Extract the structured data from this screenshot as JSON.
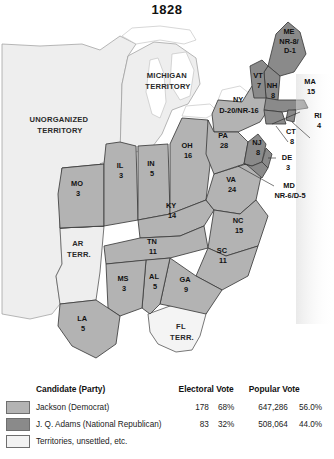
{
  "title": "1828",
  "colors": {
    "jackson": "#b3b3b3",
    "adams": "#8a8a8a",
    "territory": "#eeeeee",
    "water": "#ffffff",
    "border": "#3c3c3c"
  },
  "map": {
    "states": [
      {
        "code": "ME",
        "votes": "NR-8/\nD-1",
        "party": "adams"
      },
      {
        "code": "NH",
        "votes": "8",
        "party": "adams"
      },
      {
        "code": "VT",
        "votes": "7",
        "party": "adams"
      },
      {
        "code": "MA",
        "votes": "15",
        "party": "adams"
      },
      {
        "code": "RI",
        "votes": "4",
        "party": "adams"
      },
      {
        "code": "CT",
        "votes": "8",
        "party": "adams"
      },
      {
        "code": "NY",
        "votes": "D-20/NR-16",
        "party": "jackson"
      },
      {
        "code": "PA",
        "votes": "28",
        "party": "jackson"
      },
      {
        "code": "NJ",
        "votes": "8",
        "party": "adams"
      },
      {
        "code": "DE",
        "votes": "3",
        "party": "adams"
      },
      {
        "code": "MD",
        "votes": "NR-6/D-5",
        "party": "adams"
      },
      {
        "code": "VA",
        "votes": "24",
        "party": "jackson"
      },
      {
        "code": "NC",
        "votes": "15",
        "party": "jackson"
      },
      {
        "code": "SC",
        "votes": "11",
        "party": "jackson"
      },
      {
        "code": "GA",
        "votes": "9",
        "party": "jackson"
      },
      {
        "code": "AL",
        "votes": "5",
        "party": "jackson"
      },
      {
        "code": "MS",
        "votes": "3",
        "party": "jackson"
      },
      {
        "code": "LA",
        "votes": "5",
        "party": "jackson"
      },
      {
        "code": "TN",
        "votes": "11",
        "party": "jackson"
      },
      {
        "code": "KY",
        "votes": "14",
        "party": "jackson"
      },
      {
        "code": "OH",
        "votes": "16",
        "party": "jackson"
      },
      {
        "code": "IN",
        "votes": "5",
        "party": "jackson"
      },
      {
        "code": "IL",
        "votes": "3",
        "party": "jackson"
      },
      {
        "code": "MO",
        "votes": "3",
        "party": "jackson"
      }
    ],
    "territories": [
      {
        "name": "UNORGANIZED\nTERRITORY"
      },
      {
        "name": "MICHIGAN\nTERRITORY"
      },
      {
        "name": "AR\nTERR."
      },
      {
        "name": "FL\nTERR."
      }
    ],
    "labels": {
      "me_l1": "ME",
      "me_l2": "NR-8/",
      "me_l3": "D-1",
      "nh_l1": "NH",
      "nh_l2": "8",
      "vt_l1": "VT",
      "vt_l2": "7",
      "ma_l1": "MA",
      "ma_l2": "15",
      "ri_l1": "RI",
      "ri_l2": "4",
      "ct_l1": "CT",
      "ct_l2": "8",
      "ny_l1": "NY",
      "ny_l2": "D-20/NR-16",
      "pa_l1": "PA",
      "pa_l2": "28",
      "nj_l1": "NJ",
      "nj_l2": "8",
      "de_l1": "DE",
      "de_l2": "3",
      "md_l1": "MD",
      "md_l2": "NR-6/D-5",
      "va_l1": "VA",
      "va_l2": "24",
      "nc_l1": "NC",
      "nc_l2": "15",
      "sc_l1": "SC",
      "sc_l2": "11",
      "ga_l1": "GA",
      "ga_l2": "9",
      "al_l1": "AL",
      "al_l2": "5",
      "ms_l1": "MS",
      "ms_l2": "3",
      "la_l1": "LA",
      "la_l2": "5",
      "tn_l1": "TN",
      "tn_l2": "11",
      "ky_l1": "KY",
      "ky_l2": "14",
      "oh_l1": "OH",
      "oh_l2": "16",
      "in_l1": "IN",
      "in_l2": "5",
      "il_l1": "IL",
      "il_l2": "3",
      "mo_l1": "MO",
      "mo_l2": "3",
      "unorg_l1": "UNORGANIZED",
      "unorg_l2": "TERRITORY",
      "mich_l1": "MICHIGAN",
      "mich_l2": "TERRITORY",
      "ar_l1": "AR",
      "ar_l2": "TERR.",
      "fl_l1": "FL",
      "fl_l2": "TERR."
    }
  },
  "legend": {
    "headers": {
      "candidate": "Candidate (Party)",
      "electoral": "Electoral Vote",
      "popular": "Popular Vote"
    },
    "rows": [
      {
        "label": "Jackson (Democrat)",
        "electoral": "178",
        "electoral_pct": "68%",
        "popular": "647,286",
        "popular_pct": "56.0%",
        "swatch": "#b3b3b3"
      },
      {
        "label": "J. Q. Adams (National Republican)",
        "electoral": "83",
        "electoral_pct": "32%",
        "popular": "508,064",
        "popular_pct": "44.0%",
        "swatch": "#8a8a8a"
      },
      {
        "label": "Territories, unsettled, etc.",
        "electoral": "",
        "electoral_pct": "",
        "popular": "",
        "popular_pct": "",
        "swatch": "#f2f2f2"
      }
    ]
  }
}
